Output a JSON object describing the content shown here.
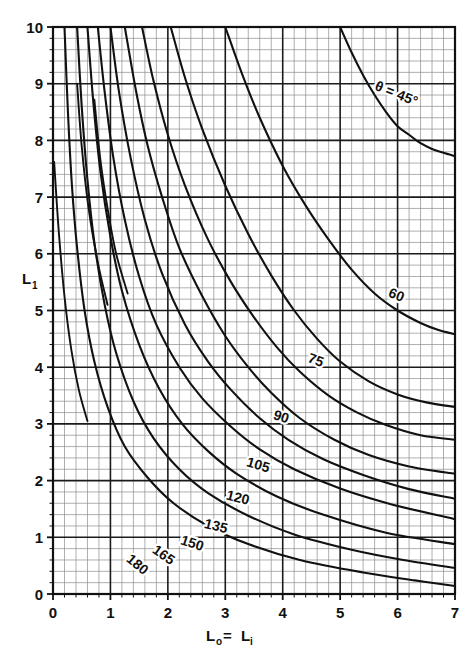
{
  "chart_data": {
    "type": "line",
    "title": "",
    "xlabel": "L₀= Lᵢ",
    "ylabel": "L₁",
    "xlim": [
      0,
      7
    ],
    "ylim": [
      0,
      10
    ],
    "xticks": [
      "0",
      "1",
      "2",
      "3",
      "4",
      "5",
      "6",
      "7"
    ],
    "yticks": [
      "0",
      "1",
      "2",
      "3",
      "4",
      "5",
      "6",
      "7",
      "8",
      "9",
      "10"
    ],
    "grid": "major and minor, 5 minor divisions per unit on both axes",
    "legend": "none; curves labelled inline with theta value",
    "annotations": [
      "θ = 45°",
      "60",
      "75",
      "90",
      "105",
      "120",
      "135",
      "150",
      "165",
      "180"
    ],
    "series": [
      {
        "name": "θ = 45°",
        "label": "θ = 45°",
        "label_x": 5.95,
        "label_y": 8.75,
        "label_rotation": 22,
        "points": [
          [
            5.0,
            10.0
          ],
          [
            5.2,
            9.55
          ],
          [
            5.4,
            9.15
          ],
          [
            5.6,
            8.8
          ],
          [
            5.8,
            8.5
          ],
          [
            6.0,
            8.25
          ],
          [
            6.2,
            8.1
          ],
          [
            6.4,
            7.95
          ],
          [
            6.6,
            7.85
          ],
          [
            6.8,
            7.78
          ],
          [
            7.0,
            7.72
          ]
        ]
      },
      {
        "name": "θ = 60°",
        "label": "60",
        "label_x": 5.95,
        "label_y": 5.2,
        "label_rotation": 22,
        "points": [
          [
            3.0,
            10.0
          ],
          [
            3.3,
            9.15
          ],
          [
            3.6,
            8.4
          ],
          [
            4.0,
            7.55
          ],
          [
            4.4,
            6.85
          ],
          [
            4.8,
            6.25
          ],
          [
            5.2,
            5.72
          ],
          [
            5.6,
            5.3
          ],
          [
            6.0,
            5.0
          ],
          [
            6.4,
            4.78
          ],
          [
            6.7,
            4.66
          ],
          [
            7.0,
            4.58
          ]
        ]
      },
      {
        "name": "θ = 75°",
        "label": "75",
        "label_x": 4.55,
        "label_y": 4.05,
        "label_rotation": 20,
        "points": [
          [
            2.05,
            10.0
          ],
          [
            2.3,
            9.1
          ],
          [
            2.6,
            8.2
          ],
          [
            3.0,
            7.2
          ],
          [
            3.4,
            6.35
          ],
          [
            3.8,
            5.62
          ],
          [
            4.2,
            5.0
          ],
          [
            4.6,
            4.5
          ],
          [
            5.0,
            4.1
          ],
          [
            5.5,
            3.75
          ],
          [
            6.0,
            3.52
          ],
          [
            6.5,
            3.38
          ],
          [
            7.0,
            3.3
          ]
        ]
      },
      {
        "name": "θ = 90°",
        "label": "90",
        "label_x": 3.95,
        "label_y": 3.05,
        "label_rotation": 18,
        "points": [
          [
            1.55,
            10.0
          ],
          [
            1.75,
            9.05
          ],
          [
            2.0,
            8.1
          ],
          [
            2.3,
            7.2
          ],
          [
            2.7,
            6.25
          ],
          [
            3.1,
            5.5
          ],
          [
            3.5,
            4.88
          ],
          [
            3.9,
            4.35
          ],
          [
            4.3,
            3.92
          ],
          [
            4.8,
            3.5
          ],
          [
            5.3,
            3.2
          ],
          [
            5.8,
            2.98
          ],
          [
            6.4,
            2.8
          ],
          [
            7.0,
            2.72
          ]
        ]
      },
      {
        "name": "θ = 105°",
        "label": "105",
        "label_x": 3.55,
        "label_y": 2.2,
        "label_rotation": 16,
        "points": [
          [
            1.25,
            10.0
          ],
          [
            1.45,
            8.85
          ],
          [
            1.65,
            7.9
          ],
          [
            1.9,
            7.0
          ],
          [
            2.2,
            6.1
          ],
          [
            2.6,
            5.25
          ],
          [
            3.0,
            4.55
          ],
          [
            3.4,
            4.0
          ],
          [
            3.8,
            3.55
          ],
          [
            4.3,
            3.1
          ],
          [
            4.9,
            2.72
          ],
          [
            5.5,
            2.45
          ],
          [
            6.2,
            2.25
          ],
          [
            7.0,
            2.12
          ]
        ]
      },
      {
        "name": "θ = 120°",
        "label": "120",
        "label_x": 3.2,
        "label_y": 1.62,
        "label_rotation": 14,
        "points": [
          [
            1.0,
            10.0
          ],
          [
            1.15,
            8.85
          ],
          [
            1.35,
            7.7
          ],
          [
            1.6,
            6.6
          ],
          [
            1.9,
            5.65
          ],
          [
            2.3,
            4.75
          ],
          [
            2.7,
            4.1
          ],
          [
            3.1,
            3.6
          ],
          [
            3.6,
            3.1
          ],
          [
            4.1,
            2.72
          ],
          [
            4.7,
            2.38
          ],
          [
            5.4,
            2.1
          ],
          [
            6.2,
            1.85
          ],
          [
            7.0,
            1.68
          ]
        ]
      },
      {
        "name": "θ = 135°",
        "label": "135",
        "label_x": 2.82,
        "label_y": 1.12,
        "label_rotation": 14,
        "points": [
          [
            0.78,
            10.0
          ],
          [
            0.9,
            8.85
          ],
          [
            1.05,
            7.7
          ],
          [
            1.25,
            6.6
          ],
          [
            1.5,
            5.6
          ],
          [
            1.8,
            4.75
          ],
          [
            2.2,
            4.0
          ],
          [
            2.6,
            3.45
          ],
          [
            3.1,
            2.95
          ],
          [
            3.6,
            2.55
          ],
          [
            4.2,
            2.2
          ],
          [
            5.0,
            1.86
          ],
          [
            5.9,
            1.58
          ],
          [
            7.0,
            1.32
          ]
        ]
      },
      {
        "name": "θ = 150°",
        "label": "150",
        "label_x": 2.4,
        "label_y": 0.82,
        "label_rotation": 18,
        "points": [
          [
            0.6,
            10.0
          ],
          [
            0.7,
            8.7
          ],
          [
            0.82,
            7.5
          ],
          [
            1.0,
            6.3
          ],
          [
            1.2,
            5.35
          ],
          [
            1.5,
            4.4
          ],
          [
            1.85,
            3.62
          ],
          [
            2.25,
            3.0
          ],
          [
            2.7,
            2.52
          ],
          [
            3.2,
            2.12
          ],
          [
            3.9,
            1.72
          ],
          [
            4.7,
            1.4
          ],
          [
            5.8,
            1.08
          ],
          [
            7.0,
            0.88
          ]
        ]
      },
      {
        "name": "θ = 165°",
        "label": "165",
        "label_x": 1.88,
        "label_y": 0.62,
        "label_rotation": 35,
        "points": [
          [
            0.42,
            10.0
          ],
          [
            0.5,
            8.6
          ],
          [
            0.6,
            7.3
          ],
          [
            0.72,
            6.2
          ],
          [
            0.9,
            5.1
          ],
          [
            1.1,
            4.25
          ],
          [
            1.4,
            3.4
          ],
          [
            1.75,
            2.75
          ],
          [
            2.2,
            2.2
          ],
          [
            2.7,
            1.78
          ],
          [
            3.4,
            1.38
          ],
          [
            4.2,
            1.05
          ],
          [
            5.2,
            0.78
          ],
          [
            6.1,
            0.6
          ],
          [
            7.0,
            0.46
          ]
        ]
      },
      {
        "name": "θ = 180°",
        "label": "180",
        "label_x": 1.42,
        "label_y": 0.46,
        "label_rotation": 40,
        "points": [
          [
            0.2,
            10.0
          ],
          [
            0.26,
            8.5
          ],
          [
            0.33,
            7.2
          ],
          [
            0.42,
            6.1
          ],
          [
            0.55,
            5.0
          ],
          [
            0.72,
            4.1
          ],
          [
            0.95,
            3.3
          ],
          [
            1.25,
            2.6
          ],
          [
            1.65,
            2.05
          ],
          [
            2.1,
            1.6
          ],
          [
            2.7,
            1.2
          ],
          [
            3.4,
            0.88
          ],
          [
            4.3,
            0.6
          ],
          [
            5.4,
            0.38
          ],
          [
            6.3,
            0.24
          ],
          [
            7.0,
            0.14
          ]
        ]
      }
    ],
    "extra_short_curves": [
      {
        "name": "short-left-a",
        "points": [
          [
            0.02,
            7.62
          ],
          [
            0.1,
            6.4
          ],
          [
            0.2,
            5.25
          ],
          [
            0.32,
            4.3
          ],
          [
            0.45,
            3.6
          ],
          [
            0.6,
            3.05
          ]
        ]
      },
      {
        "name": "short-left-b",
        "points": [
          [
            0.42,
            9.0
          ],
          [
            0.5,
            7.9
          ],
          [
            0.62,
            6.8
          ],
          [
            0.78,
            5.85
          ],
          [
            0.95,
            5.1
          ]
        ]
      },
      {
        "name": "short-left-c",
        "points": [
          [
            0.72,
            8.72
          ],
          [
            0.82,
            7.7
          ],
          [
            0.95,
            6.8
          ],
          [
            1.1,
            6.0
          ],
          [
            1.3,
            5.3
          ]
        ]
      }
    ]
  },
  "axes": {
    "y_title_main": "L",
    "y_title_sub": "1",
    "x_title_main": "L",
    "x_title_sub_o": "o",
    "x_title_eq": "=",
    "x_title_main2": "L",
    "x_title_sub_i": "i"
  },
  "theta_label": {
    "symbol": "θ",
    "equals": "=",
    "value": "45°",
    "full": "θ = 45°"
  },
  "colors": {
    "background": "#ffffff",
    "ink": "#111111",
    "grid_minor": "#8d8d8d",
    "grid_major": "#1b1b1b",
    "curve": "#111111"
  }
}
